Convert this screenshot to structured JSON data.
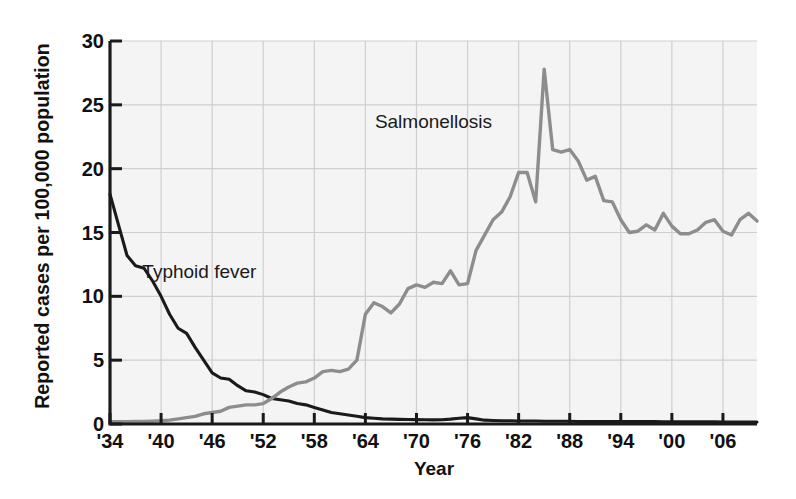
{
  "chart_data": {
    "type": "line",
    "title": "",
    "xlabel": "Year",
    "ylabel": "Reported cases per 100,000 population",
    "xlim": [
      1934,
      2010
    ],
    "ylim": [
      0,
      30
    ],
    "yticks": [
      0,
      5,
      10,
      15,
      20,
      25,
      30
    ],
    "xticks": [
      1934,
      1940,
      1946,
      1952,
      1958,
      1964,
      1970,
      1976,
      1982,
      1988,
      1994,
      2000,
      2006
    ],
    "xticklabels": [
      "'34",
      "'40",
      "'46",
      "'52",
      "'58",
      "'64",
      "'70",
      "'76",
      "'82",
      "'88",
      "'94",
      "'00",
      "'06"
    ],
    "grid": true,
    "legend_position": "inline-annotations",
    "annotations": [
      {
        "text": "Salmonellosis",
        "x": 1972,
        "y": 23.2
      },
      {
        "text": "Typhoid fever",
        "x": 1944.5,
        "y": 11.4
      }
    ],
    "series": [
      {
        "name": "Typhoid fever",
        "color": "#1a1a1a",
        "x": [
          1934,
          1935,
          1936,
          1937,
          1938,
          1939,
          1940,
          1941,
          1942,
          1943,
          1944,
          1945,
          1946,
          1947,
          1948,
          1949,
          1950,
          1951,
          1952,
          1953,
          1954,
          1955,
          1956,
          1957,
          1958,
          1959,
          1960,
          1961,
          1962,
          1963,
          1964,
          1965,
          1966,
          1967,
          1968,
          1969,
          1970,
          1971,
          1972,
          1973,
          1974,
          1975,
          1976,
          1977,
          1978,
          1979,
          1980,
          1981,
          1982,
          1983,
          1984,
          1985,
          1986,
          1987,
          1988,
          1989,
          1990,
          1991,
          1992,
          1993,
          1994,
          1995,
          1996,
          1997,
          1998,
          1999,
          2000,
          2001,
          2002,
          2003,
          2004,
          2005,
          2006,
          2007,
          2008,
          2009,
          2010
        ],
        "values": [
          18.0,
          15.6,
          13.2,
          12.4,
          12.2,
          11.2,
          10.0,
          8.6,
          7.5,
          7.1,
          6.0,
          5.0,
          4.0,
          3.6,
          3.5,
          3.0,
          2.6,
          2.5,
          2.3,
          2.0,
          1.9,
          1.8,
          1.6,
          1.5,
          1.3,
          1.1,
          0.9,
          0.8,
          0.7,
          0.6,
          0.5,
          0.45,
          0.4,
          0.38,
          0.36,
          0.35,
          0.34,
          0.33,
          0.32,
          0.33,
          0.38,
          0.45,
          0.5,
          0.4,
          0.3,
          0.28,
          0.26,
          0.25,
          0.24,
          0.24,
          0.23,
          0.22,
          0.22,
          0.21,
          0.21,
          0.2,
          0.2,
          0.2,
          0.2,
          0.2,
          0.2,
          0.2,
          0.19,
          0.19,
          0.19,
          0.18,
          0.18,
          0.18,
          0.18,
          0.17,
          0.17,
          0.17,
          0.16,
          0.16,
          0.16,
          0.16,
          0.16
        ]
      },
      {
        "name": "Salmonellosis",
        "color": "#8d8d8d",
        "x": [
          1934,
          1935,
          1936,
          1937,
          1938,
          1939,
          1940,
          1941,
          1942,
          1943,
          1944,
          1945,
          1946,
          1947,
          1948,
          1949,
          1950,
          1951,
          1952,
          1953,
          1954,
          1955,
          1956,
          1957,
          1958,
          1959,
          1960,
          1961,
          1962,
          1963,
          1964,
          1965,
          1966,
          1967,
          1968,
          1969,
          1970,
          1971,
          1972,
          1973,
          1974,
          1975,
          1976,
          1977,
          1978,
          1979,
          1980,
          1981,
          1982,
          1983,
          1984,
          1985,
          1986,
          1987,
          1988,
          1989,
          1990,
          1991,
          1992,
          1993,
          1994,
          1995,
          1996,
          1997,
          1998,
          1999,
          2000,
          2001,
          2002,
          2003,
          2004,
          2005,
          2006,
          2007,
          2008,
          2009,
          2010
        ],
        "values": [
          0.18,
          0.18,
          0.18,
          0.2,
          0.2,
          0.22,
          0.25,
          0.3,
          0.4,
          0.5,
          0.6,
          0.8,
          0.9,
          1.0,
          1.3,
          1.4,
          1.5,
          1.5,
          1.6,
          2.0,
          2.5,
          2.9,
          3.2,
          3.3,
          3.6,
          4.1,
          4.2,
          4.1,
          4.3,
          5.0,
          8.6,
          9.5,
          9.2,
          8.7,
          9.4,
          10.6,
          10.9,
          10.7,
          11.1,
          11.0,
          12.0,
          10.9,
          11.0,
          13.6,
          14.8,
          16.0,
          16.6,
          17.8,
          19.7,
          19.7,
          17.4,
          27.8,
          21.5,
          21.3,
          21.5,
          20.6,
          19.1,
          19.4,
          17.5,
          17.4,
          16.0,
          15.0,
          15.1,
          15.6,
          15.2,
          16.5,
          15.5,
          14.9,
          14.9,
          15.2,
          15.8,
          16.0,
          15.1,
          14.8,
          16.0,
          16.5,
          15.9
        ]
      }
    ]
  },
  "axis": {
    "ylabel": "Reported cases per 100,000 population",
    "xlabel": "Year",
    "yticklabels": [
      "0",
      "5",
      "10",
      "15",
      "20",
      "25",
      "30"
    ],
    "xticklabels": [
      "'34",
      "'40",
      "'46",
      "'52",
      "'58",
      "'64",
      "'70",
      "'76",
      "'82",
      "'88",
      "'94",
      "'00",
      "'06"
    ]
  },
  "labels": {
    "salmonellosis": "Salmonellosis",
    "typhoid": "Typhoid fever"
  },
  "colors": {
    "typhoid_line": "#1a1a1a",
    "salmonella_line": "#8d8d8d",
    "plot_background": "#f4f4f4",
    "gridline": "#cfcfcf",
    "axis": "#1a1a1a",
    "text": "#111111"
  }
}
